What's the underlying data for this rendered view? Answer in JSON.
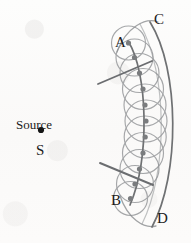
{
  "figure": {
    "background_color": "#fbfbfa",
    "ink_color": "#6f7173",
    "label_color": "#1a1a1a",
    "dot_color": "#7a7c7e",
    "source_dot_color": "#151515"
  },
  "labels": {
    "source_word": "Source",
    "source_letter": "S",
    "point_a": "A",
    "point_b": "B",
    "point_c": "C",
    "point_d": "D"
  },
  "label_positions": {
    "source_word": {
      "x": 16,
      "y": 118
    },
    "source_letter": {
      "x": 36,
      "y": 143
    },
    "point_a": {
      "x": 115,
      "y": 35
    },
    "point_b": {
      "x": 111,
      "y": 193
    },
    "point_c": {
      "x": 154,
      "y": 12
    },
    "point_d": {
      "x": 157,
      "y": 211
    }
  },
  "source_dot": {
    "x": 41,
    "y": 130,
    "r": 3.1
  },
  "geometry": {
    "primary_wavefront": {
      "name": "AB",
      "description": "primary spherical wavefront arc from A to B",
      "path": "M 128 41 C 148 72, 150 158, 130 205",
      "stroke_width": 1.7
    },
    "secondary_envelope": {
      "name": "CD",
      "description": "new wavefront, envelope of the secondary wavelets",
      "path": "M 150 22 C 180 70, 180 175, 152 227",
      "stroke_width": 1.7
    },
    "upper_cap_arc": {
      "description": "faint arc sweeping from upper-left over to C",
      "path": "M 117 52 C 126 27, 146 17, 158 22",
      "stroke_width": 1.3
    },
    "lower_cap_arc": {
      "description": "faint arc sweeping from lower-left over to D",
      "path": "M 120 196 C 128 219, 144 229, 156 226",
      "stroke_width": 1.3
    },
    "outer_faint_arc": {
      "description": "faint long outer arc left of CD",
      "path": "M 140 24 C 168 74, 168 172, 142 224",
      "stroke_width": 1.2
    }
  },
  "wavelet_points": [
    {
      "x": 128.5,
      "y": 43.0,
      "r": 2.6
    },
    {
      "x": 134.5,
      "y": 57.5,
      "r": 2.6
    },
    {
      "x": 139.5,
      "y": 73.0,
      "r": 2.6
    },
    {
      "x": 143.0,
      "y": 89.0,
      "r": 2.6
    },
    {
      "x": 145.0,
      "y": 105.0,
      "r": 2.6
    },
    {
      "x": 146.0,
      "y": 121.0,
      "r": 2.6
    },
    {
      "x": 145.2,
      "y": 137.0,
      "r": 2.6
    },
    {
      "x": 143.0,
      "y": 153.0,
      "r": 2.6
    },
    {
      "x": 139.5,
      "y": 169.0,
      "r": 2.6
    },
    {
      "x": 135.0,
      "y": 184.0,
      "r": 2.6
    },
    {
      "x": 130.5,
      "y": 198.5,
      "r": 2.6
    }
  ],
  "wavelet_circles": [
    {
      "cx": 128.5,
      "cy": 43.0,
      "r": 17.0
    },
    {
      "cx": 134.5,
      "cy": 57.5,
      "r": 18.5
    },
    {
      "cx": 139.5,
      "cy": 73.0,
      "r": 19.5
    },
    {
      "cx": 143.0,
      "cy": 89.0,
      "r": 20.5
    },
    {
      "cx": 145.0,
      "cy": 105.0,
      "r": 21.0
    },
    {
      "cx": 146.0,
      "cy": 121.0,
      "r": 21.0
    },
    {
      "cx": 145.2,
      "cy": 137.0,
      "r": 21.0
    },
    {
      "cx": 143.0,
      "cy": 153.0,
      "r": 20.5
    },
    {
      "cx": 139.5,
      "cy": 169.0,
      "r": 19.5
    },
    {
      "cx": 135.0,
      "cy": 184.0,
      "r": 18.5
    },
    {
      "cx": 130.5,
      "cy": 198.5,
      "r": 17.0
    }
  ],
  "rays": [
    {
      "name": "upper-ray",
      "description": "straight ray crossing the wavefront near A, pointing up-right",
      "x1": 98,
      "y1": 84,
      "x2": 152,
      "y2": 61,
      "stroke_width": 1.9
    },
    {
      "name": "lower-ray",
      "description": "straight ray crossing the wavefront near B, pointing down-right",
      "x1": 100,
      "y1": 163,
      "x2": 153,
      "y2": 185,
      "stroke_width": 1.9
    }
  ]
}
